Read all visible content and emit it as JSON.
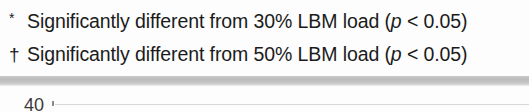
{
  "footnotes": [
    {
      "marker": "*",
      "marker_name": "asterisk",
      "text_before": "Significantly different from 30% LBM load (",
      "italic_symbol": "p",
      "text_after": " < 0.05)",
      "full_text": "Significantly different from 30% LBM load (p < 0.05)",
      "reference_load": "30%",
      "p_threshold": "0.05"
    },
    {
      "marker": "†",
      "marker_name": "dagger",
      "text_before": "Significantly different from 50% LBM load (",
      "italic_symbol": "p",
      "text_after": " < 0.05)",
      "full_text": "Significantly different from 50% LBM load (p < 0.05)",
      "reference_load": "50%",
      "p_threshold": "0.05"
    }
  ],
  "separator": {
    "color": "#bfbfbf"
  },
  "chart_fragment": {
    "axis_tick_label": "40",
    "has_gridline": true,
    "gridline_color": "#d7d7d7"
  }
}
